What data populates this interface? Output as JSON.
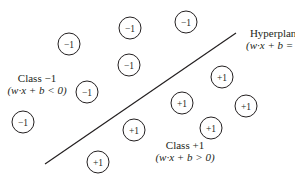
{
  "diagram": {
    "type": "svm-hyperplane",
    "hyperplane": {
      "title": "Hyperplane",
      "equation": "(w·x + b = 0)",
      "line": {
        "x1": 45,
        "y1": 164,
        "x2": 236,
        "y2": 33
      }
    },
    "class_neg": {
      "title": "Class −1",
      "equation": "(w·x + b < 0)"
    },
    "class_pos": {
      "title": "Class +1",
      "equation": "(w·x + b > 0)"
    },
    "point_radius": 11,
    "stroke_color": "#231f20",
    "points": [
      {
        "label": "−1",
        "cx": 69,
        "cy": 44
      },
      {
        "label": "−1",
        "cx": 130,
        "cy": 28
      },
      {
        "label": "−1",
        "cx": 186,
        "cy": 22
      },
      {
        "label": "−1",
        "cx": 129,
        "cy": 65
      },
      {
        "label": "−1",
        "cx": 87,
        "cy": 92
      },
      {
        "label": "−1",
        "cx": 23,
        "cy": 122
      },
      {
        "label": "+1",
        "cx": 222,
        "cy": 77
      },
      {
        "label": "+1",
        "cx": 182,
        "cy": 103
      },
      {
        "label": "+1",
        "cx": 246,
        "cy": 106
      },
      {
        "label": "+1",
        "cx": 134,
        "cy": 130
      },
      {
        "label": "+1",
        "cx": 211,
        "cy": 128
      },
      {
        "label": "+1",
        "cx": 98,
        "cy": 162
      }
    ]
  }
}
